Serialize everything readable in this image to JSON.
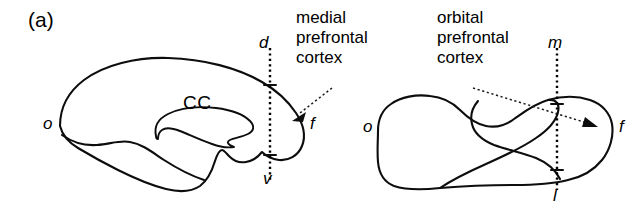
{
  "figure": {
    "panel_label": "(a)",
    "background_color": "#ffffff",
    "stroke_color": "#0d0d0d"
  },
  "left_diagram": {
    "name": "medial view of brain",
    "callout_lines": [
      "medial",
      "prefrontal",
      "cortex"
    ],
    "structure_label": "CC",
    "axis_top": "d",
    "axis_bottom": "v",
    "pole_posterior": "o",
    "pole_anterior": "f"
  },
  "right_diagram": {
    "name": "orbital view of brain",
    "callout_lines": [
      "orbital",
      "prefrontal",
      "cortex"
    ],
    "axis_top": "m",
    "axis_bottom": "l",
    "pole_posterior": "o",
    "pole_anterior": "f"
  }
}
